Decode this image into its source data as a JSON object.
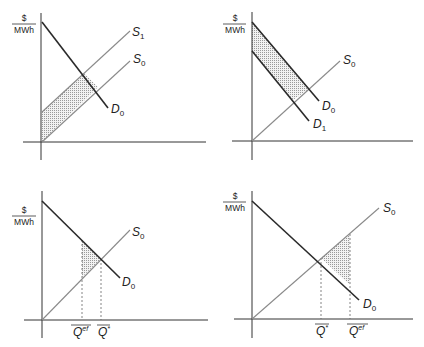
{
  "figure": {
    "axis_unit": {
      "numerator": "$",
      "denominator": "MWh"
    },
    "panels": [
      {
        "id": "top-left",
        "curves": [
          {
            "name": "D",
            "sub": "0",
            "kind": "demand"
          },
          {
            "name": "S",
            "sub": "1",
            "kind": "supply"
          },
          {
            "name": "S",
            "sub": "0",
            "kind": "supply"
          }
        ],
        "shaded": "area between S0 and S1 left of D0"
      },
      {
        "id": "top-right",
        "curves": [
          {
            "name": "D",
            "sub": "0",
            "kind": "demand"
          },
          {
            "name": "D",
            "sub": "1",
            "kind": "demand"
          },
          {
            "name": "S",
            "sub": "0",
            "kind": "supply"
          }
        ],
        "shaded": "area between D0 and D1 above S0"
      },
      {
        "id": "bottom-left",
        "curves": [
          {
            "name": "D",
            "sub": "0",
            "kind": "demand"
          },
          {
            "name": "S",
            "sub": "0",
            "kind": "supply"
          }
        ],
        "quantities": [
          {
            "name": "Q",
            "sup": "ef"
          },
          {
            "name": "Q",
            "sup": "*"
          }
        ],
        "shaded": "triangle between Qef and Q* under D0 above S0"
      },
      {
        "id": "bottom-right",
        "curves": [
          {
            "name": "S",
            "sub": "0",
            "kind": "supply"
          },
          {
            "name": "D",
            "sub": "0",
            "kind": "demand"
          }
        ],
        "quantities": [
          {
            "name": "Q",
            "sup": "*"
          },
          {
            "name": "Q",
            "sup": "ef"
          }
        ],
        "shaded": "triangle between Q* and Qef under S0 above D0"
      }
    ]
  }
}
